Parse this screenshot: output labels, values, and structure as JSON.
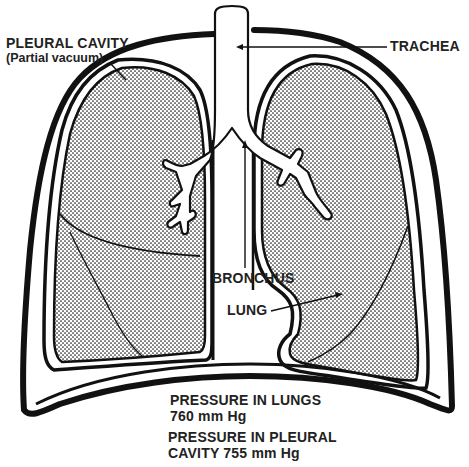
{
  "diagram": {
    "colors": {
      "ink": "#111111",
      "background": "#ffffff",
      "stipple": "#1a1a1a"
    },
    "labels": {
      "pleural_cavity": "PLEURAL CAVITY",
      "pleural_cavity_note": "(Partial vacuum)",
      "trachea": "TRACHEA",
      "bronchus": "BRONCHUS",
      "lung": "LUNG",
      "pressure_lungs_line1": "PRESSURE IN LUNGS",
      "pressure_lungs_line2": "760 mm Hg",
      "pressure_pleural_line1": "PRESSURE IN PLEURAL",
      "pressure_pleural_line2": "CAVITY 755 mm Hg"
    },
    "values": {
      "pressure_lungs_mmHg": 760,
      "pressure_pleural_mmHg": 755
    }
  }
}
